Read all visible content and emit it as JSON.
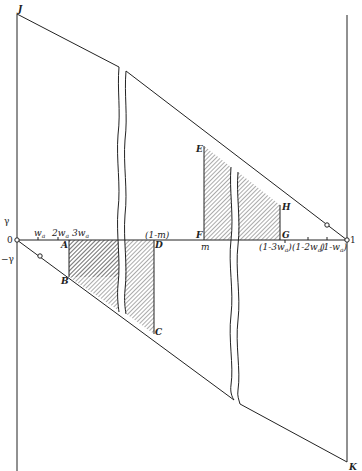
{
  "diagram": {
    "corner_labels": {
      "top_left": "J",
      "bottom_right": "K"
    },
    "axis": {
      "origin": "0",
      "end": "1",
      "gamma_pos": "γ",
      "gamma_neg": "−γ",
      "ticks_left": [
        "w",
        "2w",
        "3w"
      ],
      "ticks_left_sub": "a",
      "tick_1m": "(1-m)",
      "tick_m": "m",
      "ticks_right": [
        "(1-3w",
        "(1-2w",
        "(1-w"
      ],
      "ticks_right_suffix": ")"
    },
    "points": {
      "A": "A",
      "B": "B",
      "C": "C",
      "D": "D",
      "E": "E",
      "F": "F",
      "G": "G",
      "H": "H"
    },
    "colors": {
      "line": "#222222",
      "hatch": "#444444",
      "background": "#ffffff"
    }
  }
}
